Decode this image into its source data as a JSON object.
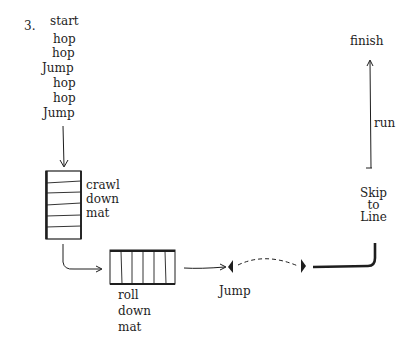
{
  "diagram": {
    "number": "3.",
    "start_sequence": [
      "start",
      "hop",
      "hop",
      "Jump",
      "hop",
      "hop",
      "Jump"
    ],
    "crawl_label": [
      "crawl",
      "down",
      "mat"
    ],
    "roll_label": [
      "roll",
      "down",
      "mat"
    ],
    "jump_label": "Jump",
    "skip_label": [
      "Skip",
      "to",
      "Line"
    ],
    "run_label": "run",
    "finish_label": "finish",
    "ink_color": "#1e1e1e",
    "background_color": "#ffffff"
  }
}
